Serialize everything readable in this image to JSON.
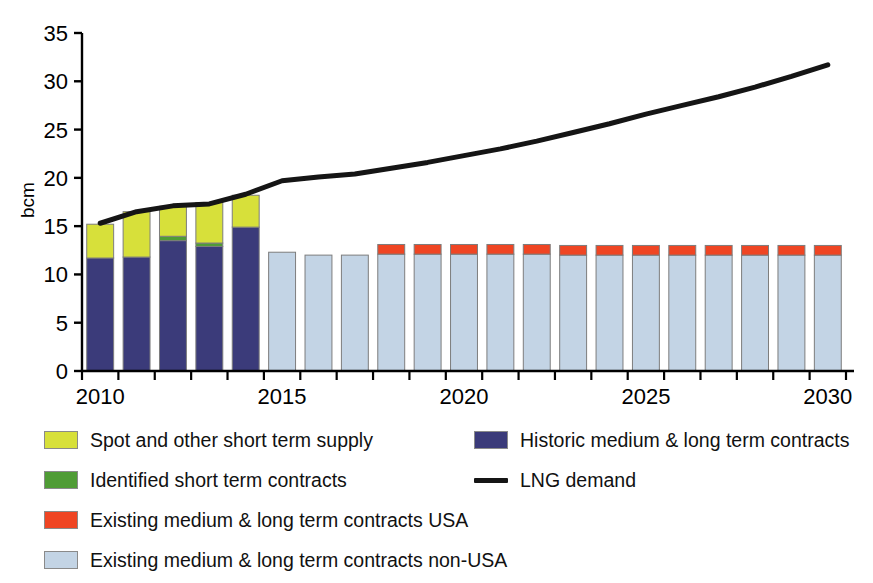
{
  "chart_data": {
    "type": "bar",
    "title": "",
    "subtitle": "",
    "xlabel": "",
    "ylabel": "bcm",
    "ylim": [
      0,
      35
    ],
    "ytick_values": [
      0,
      5,
      10,
      15,
      20,
      25,
      30,
      35
    ],
    "ytick_labels": [
      "0",
      "5",
      "10",
      "15",
      "20",
      "25",
      "30",
      "35"
    ],
    "xlim": [
      2009.5,
      2030.5
    ],
    "categories": [
      2010,
      2011,
      2012,
      2013,
      2014,
      2015,
      2016,
      2017,
      2018,
      2019,
      2020,
      2021,
      2022,
      2023,
      2024,
      2025,
      2026,
      2027,
      2028,
      2029,
      2030
    ],
    "xtick_values": [
      2010,
      2015,
      2020,
      2025,
      2030
    ],
    "xtick_labels": [
      "2010",
      "2015",
      "2020",
      "2025",
      "2030"
    ],
    "grid": false,
    "legend_position": "below",
    "stacking": "stacked",
    "series": [
      {
        "name": "Historic medium & long term contracts",
        "key": "historic_ml",
        "color": "#3b3b7a",
        "type": "bar",
        "values": [
          11.7,
          11.8,
          13.5,
          12.9,
          14.9,
          0,
          0,
          0,
          0,
          0,
          0,
          0,
          0,
          0,
          0,
          0,
          0,
          0,
          0,
          0,
          0
        ]
      },
      {
        "name": "Identified short term contracts",
        "key": "identified_short",
        "color": "#4f9c35",
        "type": "bar",
        "values": [
          0,
          0,
          0.45,
          0.35,
          0,
          0,
          0,
          0,
          0,
          0,
          0,
          0,
          0,
          0,
          0,
          0,
          0,
          0,
          0,
          0,
          0
        ]
      },
      {
        "name": "Spot and other short term supply",
        "key": "spot_short",
        "color": "#d7e03a",
        "type": "bar",
        "values": [
          3.5,
          4.7,
          3.1,
          4.2,
          3.3,
          0,
          0,
          0,
          0,
          0,
          0,
          0,
          0,
          0,
          0,
          0,
          0,
          0,
          0,
          0,
          0
        ]
      },
      {
        "name": "Existing medium & long term contracts non-USA",
        "key": "existing_ml_nonusa",
        "color": "#c3d4e5",
        "type": "bar",
        "values": [
          0,
          0,
          0,
          0,
          0,
          12.3,
          12.0,
          12.0,
          12.1,
          12.1,
          12.1,
          12.1,
          12.1,
          12.0,
          12.0,
          12.0,
          12.0,
          12.0,
          12.0,
          12.0,
          12.0
        ]
      },
      {
        "name": "Existing medium  & long term contracts USA",
        "key": "existing_ml_usa",
        "color": "#ef4523",
        "type": "bar",
        "values": [
          0,
          0,
          0,
          0,
          0,
          0,
          0,
          0,
          1.0,
          1.0,
          1.0,
          1.0,
          1.0,
          1.0,
          1.0,
          1.0,
          1.0,
          1.0,
          1.0,
          1.0,
          1.0
        ]
      },
      {
        "name": "LNG demand",
        "key": "lng_demand",
        "color": "#151515",
        "type": "line",
        "values": [
          15.3,
          16.5,
          17.1,
          17.3,
          18.3,
          19.7,
          20.1,
          20.4,
          21.0,
          21.6,
          22.3,
          23.0,
          23.8,
          24.7,
          25.6,
          26.6,
          27.5,
          28.4,
          29.4,
          30.5,
          31.7
        ]
      }
    ]
  },
  "axis": {
    "y_title": "bcm"
  },
  "legend": {
    "left_column": [
      {
        "label": "Spot and other short term supply",
        "color": "#d7e03a",
        "marker": "swatch"
      },
      {
        "label": "Identified short term contracts",
        "color": "#4f9c35",
        "marker": "swatch"
      },
      {
        "label": "Existing medium  & long term contracts USA",
        "color": "#ef4523",
        "marker": "swatch"
      },
      {
        "label": "Existing medium & long term contracts non-USA",
        "color": "#c3d4e5",
        "marker": "swatch"
      }
    ],
    "right_column": [
      {
        "label": "Historic medium & long term contracts",
        "color": "#3b3b7a",
        "marker": "swatch"
      },
      {
        "label": "LNG demand",
        "color": "#151515",
        "marker": "line"
      }
    ]
  }
}
